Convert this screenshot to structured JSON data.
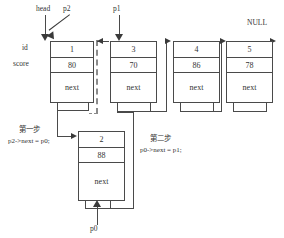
{
  "diagram": {
    "row_labels": {
      "id": "id",
      "score": "score",
      "next": "next"
    },
    "pointers": {
      "head": "head",
      "p2": "p2",
      "p1": "p1",
      "p0": "p0",
      "null": "NULL"
    },
    "nodes": [
      {
        "id": "1",
        "score": "80",
        "next": "next"
      },
      {
        "id": "3",
        "score": "70",
        "next": "next"
      },
      {
        "id": "4",
        "score": "86",
        "next": "next"
      },
      {
        "id": "5",
        "score": "78",
        "next": "next"
      }
    ],
    "new_node": {
      "id": "2",
      "score": "88",
      "next": "next"
    },
    "steps": [
      {
        "title": "第一步",
        "code": "p2->next = p0;"
      },
      {
        "title": "第二步",
        "code": "p0->next = p1;"
      }
    ],
    "colors": {
      "stroke": "#4a4a4a",
      "arrow": "#3a3a3a",
      "dashed": "#8a8a8a",
      "background": "#ffffff"
    }
  }
}
